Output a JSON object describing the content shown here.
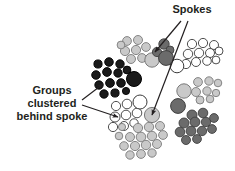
{
  "figure": {
    "type": "cluster-spoke-diagram",
    "background_color": "#ffffff",
    "width": 235,
    "height": 171
  },
  "annotations": {
    "spokes": {
      "label": "Spokes",
      "text_color": "#231f20",
      "x": 192,
      "y": 13,
      "anchor": "middle",
      "font_size": 11
    },
    "groups": {
      "lines": [
        "Groups",
        "clustered",
        "behind spoke"
      ],
      "text_color": "#231f20",
      "x": 52,
      "y_start": 94,
      "line_height": 13,
      "anchor": "middle",
      "font_size": 11
    }
  },
  "arrows": {
    "color": "#231f20",
    "stroke_width": 1.2,
    "items": [
      {
        "name": "spokes-arrow-to-dark-spoke",
        "from": [
          181,
          21
        ],
        "to": [
          155,
          52
        ]
      },
      {
        "name": "spokes-arrow-to-light-spoke",
        "from": [
          188,
          21
        ],
        "to": [
          152,
          115
        ]
      },
      {
        "name": "groups-arrow-to-black-cluster",
        "from": [
          82,
          100
        ],
        "to": [
          103,
          84
        ]
      },
      {
        "name": "groups-arrow-to-white-cluster",
        "from": [
          82,
          105
        ],
        "to": [
          118,
          117
        ]
      }
    ]
  },
  "palette": {
    "black_fill": "#1a1a1a",
    "black_stroke": "#000000",
    "white_fill": "#ffffff",
    "white_stroke": "#3b3b3b",
    "light_gray_fill": "#c9c9c9",
    "light_gray_stroke": "#7a7a7a",
    "mid_gray_fill": "#a8a8a8",
    "mid_gray_stroke": "#6a6a6a",
    "dark_gray_fill": "#6b6b6b",
    "dark_gray_stroke": "#3f3f3f"
  },
  "chart_data": {
    "type": "scatter",
    "title": "",
    "xlabel": "",
    "ylabel": "",
    "clusters": [
      {
        "name": "black-cluster",
        "fill": "#1a1a1a",
        "stroke": "#000000",
        "spoke": {
          "cx": 134,
          "cy": 79,
          "r": 7.5
        },
        "nodes": [
          {
            "cx": 98,
            "cy": 64,
            "r": 4.1
          },
          {
            "cx": 109,
            "cy": 62,
            "r": 4.3
          },
          {
            "cx": 120,
            "cy": 64,
            "r": 4.2
          },
          {
            "cx": 96,
            "cy": 75,
            "r": 4.3
          },
          {
            "cx": 107,
            "cy": 72,
            "r": 4.4
          },
          {
            "cx": 118,
            "cy": 73,
            "r": 4.2
          },
          {
            "cx": 127,
            "cy": 70,
            "r": 3.9
          },
          {
            "cx": 99,
            "cy": 85,
            "r": 4.2
          },
          {
            "cx": 110,
            "cy": 83,
            "r": 4.4
          },
          {
            "cx": 121,
            "cy": 83,
            "r": 4.3
          },
          {
            "cx": 104,
            "cy": 94,
            "r": 4.2
          },
          {
            "cx": 115,
            "cy": 93,
            "r": 4.1
          },
          {
            "cx": 126,
            "cy": 91,
            "r": 3.6
          }
        ]
      },
      {
        "name": "white-cluster-left",
        "fill": "#ffffff",
        "stroke": "#3b3b3b",
        "spoke": {
          "cx": 140,
          "cy": 102,
          "r": 7.0
        },
        "nodes": [
          {
            "cx": 116,
            "cy": 106,
            "r": 4.6
          },
          {
            "cx": 127,
            "cy": 104,
            "r": 4.8
          },
          {
            "cx": 137,
            "cy": 113,
            "r": 4.8
          },
          {
            "cx": 115,
            "cy": 117,
            "r": 5.0
          },
          {
            "cx": 126,
            "cy": 115,
            "r": 4.8
          },
          {
            "cx": 113,
            "cy": 127,
            "r": 4.6
          },
          {
            "cx": 124,
            "cy": 126,
            "r": 4.5
          },
          {
            "cx": 134,
            "cy": 123,
            "r": 4.2
          }
        ]
      },
      {
        "name": "light-gray-cluster-top",
        "fill": "#c9c9c9",
        "stroke": "#7a7a7a",
        "spoke": {
          "cx": 152,
          "cy": 60,
          "r": 7.2
        },
        "nodes": [
          {
            "cx": 127,
            "cy": 41,
            "r": 4.4
          },
          {
            "cx": 138,
            "cy": 40,
            "r": 4.5
          },
          {
            "cx": 125,
            "cy": 51,
            "r": 4.6
          },
          {
            "cx": 136,
            "cy": 50,
            "r": 4.6
          },
          {
            "cx": 146,
            "cy": 47,
            "r": 4.4
          },
          {
            "cx": 131,
            "cy": 59,
            "r": 4.5
          },
          {
            "cx": 142,
            "cy": 58,
            "r": 4.4
          },
          {
            "cx": 121,
            "cy": 45,
            "r": 3.9
          }
        ]
      },
      {
        "name": "dark-gray-cluster-top",
        "fill": "#6b6b6b",
        "stroke": "#3f3f3f",
        "spoke": {
          "cx": 166,
          "cy": 58,
          "r": 7.4
        },
        "nodes": [
          {
            "cx": 164,
            "cy": 44,
            "r": 5.2
          },
          {
            "cx": 157,
            "cy": 52,
            "r": 4.6
          },
          {
            "cx": 170,
            "cy": 50,
            "r": 4.0
          }
        ]
      },
      {
        "name": "white-cluster-right",
        "fill": "#ffffff",
        "stroke": "#3b3b3b",
        "spoke": {
          "cx": 177,
          "cy": 66,
          "r": 6.8
        },
        "nodes": [
          {
            "cx": 192,
            "cy": 44,
            "r": 4.6
          },
          {
            "cx": 203,
            "cy": 43,
            "r": 4.6
          },
          {
            "cx": 214,
            "cy": 45,
            "r": 4.5
          },
          {
            "cx": 188,
            "cy": 54,
            "r": 4.7
          },
          {
            "cx": 199,
            "cy": 53,
            "r": 4.7
          },
          {
            "cx": 210,
            "cy": 53,
            "r": 4.5
          },
          {
            "cx": 219,
            "cy": 51,
            "r": 4.0
          },
          {
            "cx": 186,
            "cy": 64,
            "r": 4.6
          },
          {
            "cx": 196,
            "cy": 62,
            "r": 4.5
          },
          {
            "cx": 207,
            "cy": 61,
            "r": 4.3
          },
          {
            "cx": 216,
            "cy": 60,
            "r": 3.9
          }
        ]
      },
      {
        "name": "light-gray-cluster-right",
        "fill": "#c9c9c9",
        "stroke": "#7a7a7a",
        "spoke": {
          "cx": 184,
          "cy": 91,
          "r": 7.2
        },
        "nodes": [
          {
            "cx": 198,
            "cy": 82,
            "r": 4.4
          },
          {
            "cx": 209,
            "cy": 81,
            "r": 4.2
          },
          {
            "cx": 218,
            "cy": 83,
            "r": 3.8
          },
          {
            "cx": 196,
            "cy": 92,
            "r": 4.5
          },
          {
            "cx": 207,
            "cy": 91,
            "r": 4.2
          },
          {
            "cx": 216,
            "cy": 93,
            "r": 3.7
          },
          {
            "cx": 200,
            "cy": 100,
            "r": 4.0
          },
          {
            "cx": 210,
            "cy": 99,
            "r": 3.8
          }
        ]
      },
      {
        "name": "dark-gray-cluster-bottom",
        "fill": "#6b6b6b",
        "stroke": "#3f3f3f",
        "spoke": {
          "cx": 178,
          "cy": 106,
          "r": 7.4
        },
        "nodes": [
          {
            "cx": 192,
            "cy": 115,
            "r": 5.0
          },
          {
            "cx": 203,
            "cy": 113,
            "r": 4.8
          },
          {
            "cx": 184,
            "cy": 123,
            "r": 5.0
          },
          {
            "cx": 195,
            "cy": 122,
            "r": 4.9
          },
          {
            "cx": 206,
            "cy": 122,
            "r": 4.7
          },
          {
            "cx": 214,
            "cy": 118,
            "r": 4.4
          },
          {
            "cx": 180,
            "cy": 132,
            "r": 4.8
          },
          {
            "cx": 191,
            "cy": 131,
            "r": 4.9
          },
          {
            "cx": 202,
            "cy": 131,
            "r": 4.7
          },
          {
            "cx": 212,
            "cy": 129,
            "r": 4.4
          },
          {
            "cx": 186,
            "cy": 140,
            "r": 4.5
          },
          {
            "cx": 197,
            "cy": 139,
            "r": 4.4
          }
        ]
      },
      {
        "name": "light-gray-cluster-bottom",
        "fill": "#c9c9c9",
        "stroke": "#7a7a7a",
        "spoke": {
          "cx": 152,
          "cy": 115,
          "r": 7.6
        },
        "nodes": [
          {
            "cx": 138,
            "cy": 128,
            "r": 4.6
          },
          {
            "cx": 149,
            "cy": 127,
            "r": 4.7
          },
          {
            "cx": 160,
            "cy": 126,
            "r": 4.5
          },
          {
            "cx": 130,
            "cy": 137,
            "r": 4.5
          },
          {
            "cx": 141,
            "cy": 137,
            "r": 4.8
          },
          {
            "cx": 152,
            "cy": 136,
            "r": 4.7
          },
          {
            "cx": 163,
            "cy": 135,
            "r": 4.4
          },
          {
            "cx": 124,
            "cy": 146,
            "r": 4.3
          },
          {
            "cx": 135,
            "cy": 146,
            "r": 4.6
          },
          {
            "cx": 146,
            "cy": 145,
            "r": 4.7
          },
          {
            "cx": 157,
            "cy": 144,
            "r": 4.5
          },
          {
            "cx": 130,
            "cy": 155,
            "r": 4.2
          },
          {
            "cx": 141,
            "cy": 154,
            "r": 4.4
          },
          {
            "cx": 152,
            "cy": 153,
            "r": 4.2
          },
          {
            "cx": 119,
            "cy": 136,
            "r": 3.8
          },
          {
            "cx": 122,
            "cy": 127,
            "r": 3.6
          }
        ]
      }
    ]
  }
}
